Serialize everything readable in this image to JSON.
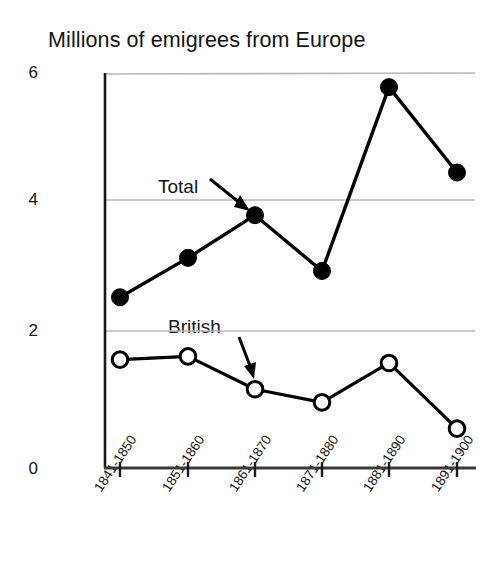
{
  "chart_data": {
    "type": "line",
    "title": "Millions of emigrees from Europe",
    "xlabel": "",
    "ylabel": "",
    "ylim": [
      0,
      6
    ],
    "yticks": [
      0,
      2,
      4,
      6
    ],
    "grid": "horizontal",
    "legend_position": "inline-annotations",
    "categories": [
      "1841-1850",
      "1851-1860",
      "1861-1870",
      "1871-1880",
      "1881-1890",
      "1891-1900"
    ],
    "series": [
      {
        "name": "Total",
        "marker": "filled-circle",
        "color": "#000000",
        "values": [
          2.6,
          3.2,
          3.85,
          3.0,
          5.8,
          4.5
        ]
      },
      {
        "name": "British",
        "marker": "open-circle",
        "color": "#000000",
        "values": [
          1.65,
          1.7,
          1.2,
          1.0,
          1.6,
          0.6
        ]
      }
    ],
    "annotations": [
      {
        "text": "Total",
        "points_to_series": "Total",
        "points_to_category": "1861-1870"
      },
      {
        "text": "British",
        "points_to_series": "British",
        "points_to_category": "1861-1870"
      }
    ]
  },
  "colors": {
    "axis": "#1a1a1a",
    "gridline": "#b9b9b9",
    "series_line": "#000000",
    "background": "#ffffff"
  }
}
